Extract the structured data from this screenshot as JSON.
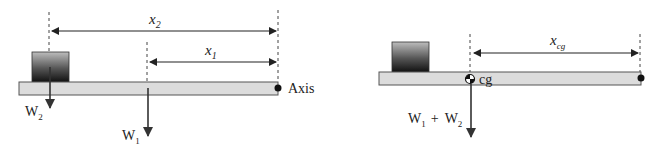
{
  "left_panel": {
    "dimension_top": {
      "symbol": "x",
      "subscript": "2"
    },
    "dimension_bottom": {
      "symbol": "x",
      "subscript": "1"
    },
    "weight_box": {
      "symbol": "W",
      "subscript": "2"
    },
    "weight_beam": {
      "symbol": "W",
      "subscript": "1"
    },
    "axis_label": "Axis"
  },
  "right_panel": {
    "dimension": {
      "symbol": "x",
      "subscript": "cg"
    },
    "cg_label": "cg",
    "combined_weight": {
      "w1": "W",
      "w1_sub": "1",
      "plus": "+",
      "w2": "W",
      "w2_sub": "2"
    }
  },
  "colors": {
    "beam_fill": "#dcdcdc",
    "beam_stroke": "#555555",
    "line": "#333333",
    "box_top": "#bdbdbd",
    "box_bottom": "#111111"
  }
}
